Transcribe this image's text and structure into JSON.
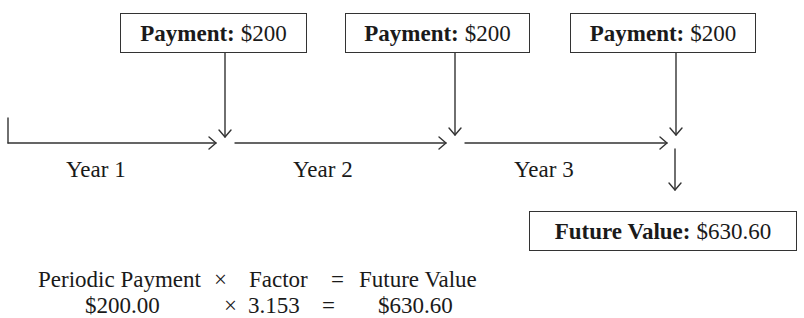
{
  "payments": [
    {
      "label": "Payment:",
      "amount": "$200"
    },
    {
      "label": "Payment:",
      "amount": "$200"
    },
    {
      "label": "Payment:",
      "amount": "$200"
    }
  ],
  "timeline": {
    "periods": [
      "Year 1",
      "Year 2",
      "Year 3"
    ]
  },
  "result": {
    "label": "Future Value:",
    "amount": "$630.60"
  },
  "formula": {
    "line1": {
      "term1": "Periodic Payment",
      "op1": "×",
      "term2": "Factor",
      "op2": "=",
      "term3": "Future Value"
    },
    "line2": {
      "term1": "$200.00",
      "op1": "×",
      "term2": "3.153",
      "op2": "=",
      "term3": "$630.60"
    }
  },
  "colors": {
    "line": "#333333",
    "text": "#1a1a1a",
    "background": "#ffffff"
  }
}
